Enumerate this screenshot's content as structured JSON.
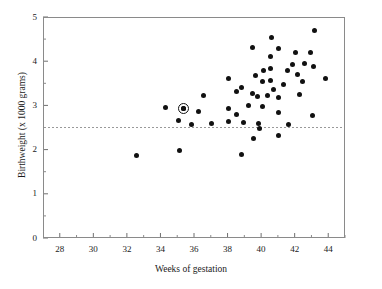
{
  "chart_data": {
    "type": "scatter",
    "title": "",
    "xlabel": "Weeks of gestation",
    "ylabel": "Birthweight (x 1000 grams)",
    "xlim": [
      27,
      45
    ],
    "ylim": [
      0,
      5
    ],
    "xticks": [
      28,
      30,
      32,
      34,
      36,
      38,
      40,
      42,
      44
    ],
    "xticklabels": [
      "28",
      "30",
      "32",
      "34",
      "36",
      "38",
      "40",
      "42",
      "44"
    ],
    "xminorticks": [
      29,
      31,
      33,
      35,
      37,
      39,
      41,
      43,
      45
    ],
    "yticks": [
      0,
      1,
      2,
      3,
      4,
      5
    ],
    "yticklabels": [
      "0",
      "1",
      "2",
      "3",
      "4",
      "5"
    ],
    "yminorticks": [
      0.5,
      1.5,
      2.5,
      3.5,
      4.5
    ],
    "grid": false,
    "legend": null,
    "marker_color": "#111111",
    "reference_line": {
      "orientation": "horizontal",
      "y": 2.5,
      "style": "dashed",
      "color": "#999999",
      "label": "2.5 kg low-birthweight threshold"
    },
    "highlighted_point": {
      "x": 35.3,
      "y": 2.96,
      "style": "circled"
    },
    "points": [
      {
        "x": 32.5,
        "y": 1.89
      },
      {
        "x": 34.25,
        "y": 2.97
      },
      {
        "x": 35.0,
        "y": 2.69
      },
      {
        "x": 35.05,
        "y": 2.01
      },
      {
        "x": 35.3,
        "y": 2.96
      },
      {
        "x": 35.8,
        "y": 2.59
      },
      {
        "x": 36.2,
        "y": 2.89
      },
      {
        "x": 36.5,
        "y": 3.25
      },
      {
        "x": 37.0,
        "y": 2.61
      },
      {
        "x": 38.0,
        "y": 3.62
      },
      {
        "x": 38.0,
        "y": 2.95
      },
      {
        "x": 38.0,
        "y": 2.66
      },
      {
        "x": 38.5,
        "y": 3.33
      },
      {
        "x": 38.5,
        "y": 2.81
      },
      {
        "x": 38.75,
        "y": 3.43
      },
      {
        "x": 38.8,
        "y": 1.92
      },
      {
        "x": 38.9,
        "y": 2.64
      },
      {
        "x": 39.2,
        "y": 3.01
      },
      {
        "x": 39.4,
        "y": 3.3
      },
      {
        "x": 39.45,
        "y": 4.33
      },
      {
        "x": 39.5,
        "y": 2.28
      },
      {
        "x": 39.6,
        "y": 3.7
      },
      {
        "x": 39.75,
        "y": 3.22
      },
      {
        "x": 39.8,
        "y": 2.62
      },
      {
        "x": 39.85,
        "y": 2.49
      },
      {
        "x": 40.0,
        "y": 3.57
      },
      {
        "x": 40.0,
        "y": 3.0
      },
      {
        "x": 40.1,
        "y": 3.81
      },
      {
        "x": 40.3,
        "y": 3.24
      },
      {
        "x": 40.5,
        "y": 4.14
      },
      {
        "x": 40.5,
        "y": 3.85
      },
      {
        "x": 40.5,
        "y": 3.59
      },
      {
        "x": 40.55,
        "y": 4.56
      },
      {
        "x": 40.7,
        "y": 3.38
      },
      {
        "x": 40.95,
        "y": 2.87
      },
      {
        "x": 41.0,
        "y": 4.31
      },
      {
        "x": 41.0,
        "y": 3.2
      },
      {
        "x": 41.0,
        "y": 2.34
      },
      {
        "x": 41.3,
        "y": 3.5
      },
      {
        "x": 41.5,
        "y": 3.81
      },
      {
        "x": 41.55,
        "y": 2.59
      },
      {
        "x": 41.8,
        "y": 3.95
      },
      {
        "x": 42.0,
        "y": 4.22
      },
      {
        "x": 42.1,
        "y": 3.72
      },
      {
        "x": 42.2,
        "y": 3.27
      },
      {
        "x": 42.4,
        "y": 3.56
      },
      {
        "x": 42.5,
        "y": 3.98
      },
      {
        "x": 42.9,
        "y": 4.22
      },
      {
        "x": 43.0,
        "y": 2.79
      },
      {
        "x": 43.05,
        "y": 3.91
      },
      {
        "x": 43.15,
        "y": 4.71
      },
      {
        "x": 43.8,
        "y": 3.63
      }
    ]
  }
}
